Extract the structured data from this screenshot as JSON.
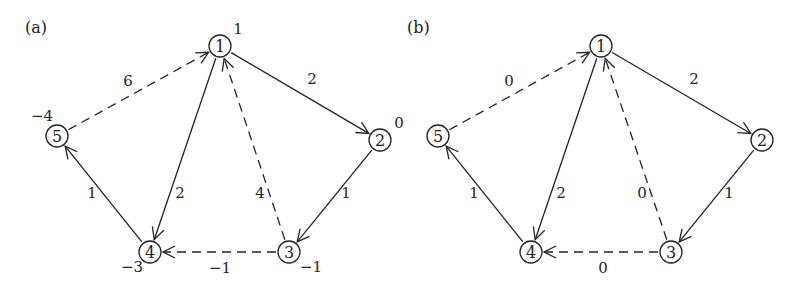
{
  "panels": [
    {
      "label": "(a)",
      "nodes": [
        {
          "id": "1",
          "x": 220,
          "y": 46,
          "potential": "1",
          "px": 238,
          "py": 34
        },
        {
          "id": "2",
          "x": 380,
          "y": 140,
          "potential": "0",
          "px": 399,
          "py": 128
        },
        {
          "id": "3",
          "x": 289,
          "y": 252,
          "potential": "−1",
          "px": 311,
          "py": 272
        },
        {
          "id": "4",
          "x": 150,
          "y": 252,
          "potential": "−3",
          "px": 132,
          "py": 272
        },
        {
          "id": "5",
          "x": 57,
          "y": 136,
          "potential": "−4",
          "px": 42,
          "py": 121
        }
      ],
      "edges": [
        {
          "from": "1",
          "to": "2",
          "weight": "2",
          "dashed": false,
          "lx": 312,
          "ly": 84
        },
        {
          "from": "2",
          "to": "3",
          "weight": "1",
          "dashed": false,
          "lx": 346,
          "ly": 198
        },
        {
          "from": "3",
          "to": "1",
          "weight": "4",
          "dashed": true,
          "lx": 260,
          "ly": 198
        },
        {
          "from": "1",
          "to": "4",
          "weight": "2",
          "dashed": false,
          "lx": 180,
          "ly": 198
        },
        {
          "from": "3",
          "to": "4",
          "weight": "−1",
          "dashed": true,
          "lx": 220,
          "ly": 273
        },
        {
          "from": "4",
          "to": "5",
          "weight": "1",
          "dashed": false,
          "lx": 92,
          "ly": 198
        },
        {
          "from": "5",
          "to": "1",
          "weight": "6",
          "dashed": true,
          "lx": 128,
          "ly": 86
        }
      ]
    },
    {
      "label": "(b)",
      "nodes": [
        {
          "id": "1",
          "x": 601,
          "y": 46
        },
        {
          "id": "2",
          "x": 762,
          "y": 140
        },
        {
          "id": "3",
          "x": 671,
          "y": 252
        },
        {
          "id": "4",
          "x": 531,
          "y": 252
        },
        {
          "id": "5",
          "x": 438,
          "y": 136
        }
      ],
      "edges": [
        {
          "from": "1",
          "to": "2",
          "weight": "2",
          "dashed": false,
          "lx": 694,
          "ly": 84
        },
        {
          "from": "2",
          "to": "3",
          "weight": "1",
          "dashed": false,
          "lx": 729,
          "ly": 198
        },
        {
          "from": "3",
          "to": "1",
          "weight": "0",
          "dashed": true,
          "lx": 642,
          "ly": 198
        },
        {
          "from": "1",
          "to": "4",
          "weight": "2",
          "dashed": false,
          "lx": 561,
          "ly": 198
        },
        {
          "from": "3",
          "to": "4",
          "weight": "0",
          "dashed": true,
          "lx": 603,
          "ly": 273
        },
        {
          "from": "4",
          "to": "5",
          "weight": "1",
          "dashed": false,
          "lx": 474,
          "ly": 198
        },
        {
          "from": "5",
          "to": "1",
          "weight": "0",
          "dashed": true,
          "lx": 509,
          "ly": 86
        }
      ]
    }
  ],
  "panel_label_pos": [
    {
      "x": 45,
      "y": 33
    },
    {
      "x": 427,
      "y": 33
    }
  ],
  "style": {
    "stroke": "#222222",
    "node_radius": 11,
    "dash": "9,6"
  }
}
